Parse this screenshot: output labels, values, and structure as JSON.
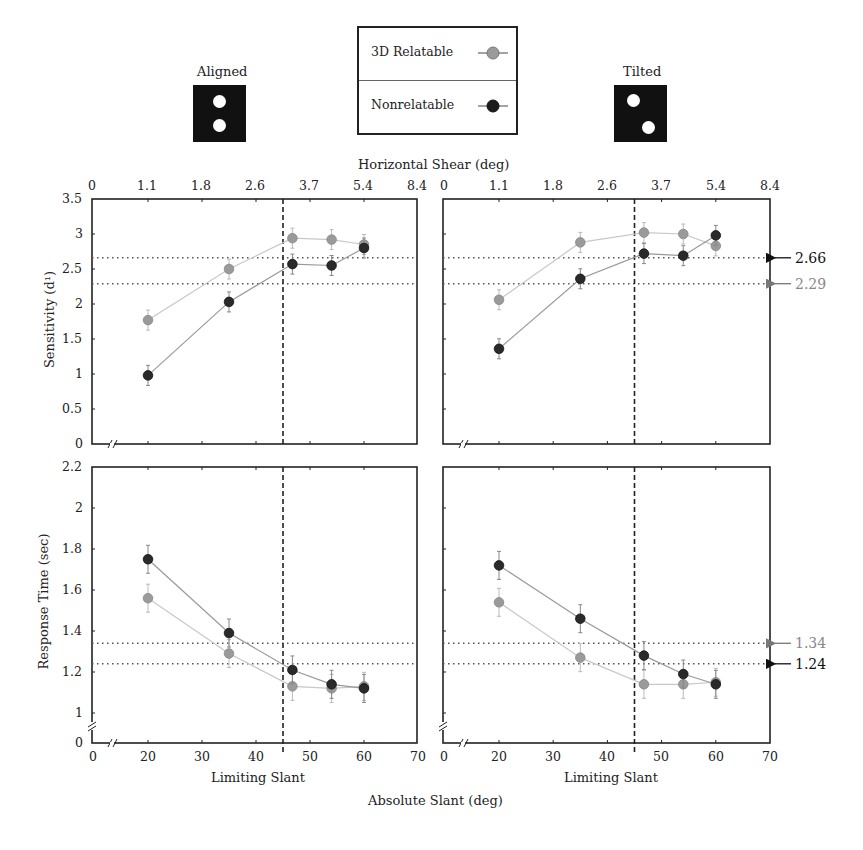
{
  "header": {
    "aligned_label": "Aligned",
    "tilted_label": "Tilted",
    "top_axis_title": "Horizontal Shear (deg)",
    "bottom_axis_title": "Absolute Slant (deg)"
  },
  "legend": {
    "items": [
      {
        "label": "3D Relatable",
        "color": "#9a9a9a"
      },
      {
        "label": "Nonrelatable",
        "color": "#2a2a2a"
      }
    ]
  },
  "axes": {
    "top_ticks": [
      "0",
      "1.1",
      "1.8",
      "2.6",
      "3.7",
      "5.4",
      "8.4"
    ],
    "bottom_ticks": [
      "0",
      "20",
      "30",
      "40",
      "50",
      "60",
      "70"
    ],
    "bottom_xlabel": "Limiting Slant",
    "sens_ylabel": "Sensitivity (d¹)",
    "sens_ticks": [
      "3.5",
      "3",
      "2.5",
      "2",
      "1.5",
      "1",
      "0.5",
      "0"
    ],
    "rt_ylabel": "Response Time (sec)",
    "rt_ticks": [
      "2.2",
      "2",
      "1.8",
      "1.6",
      "1.4",
      "1.2",
      "1",
      "0"
    ]
  },
  "annotations": {
    "sens_ref_high": "2.66",
    "sens_ref_low": "2.29",
    "rt_ref_high": "1.34",
    "rt_ref_low": "1.24"
  },
  "chart_data": [
    {
      "type": "line",
      "title": "Aligned - Sensitivity",
      "xlabel": "Limiting Slant",
      "ylabel": "Sensitivity (d')",
      "x": [
        20,
        35,
        46,
        54,
        60
      ],
      "x2_label": "Horizontal Shear (deg)",
      "x2_ticks": [
        0,
        1.1,
        1.8,
        2.6,
        3.7,
        5.4,
        8.4
      ],
      "ylim": [
        0,
        3.5
      ],
      "series": [
        {
          "name": "3D Relatable",
          "values": [
            1.77,
            2.5,
            2.94,
            2.92,
            2.85
          ]
        },
        {
          "name": "Nonrelatable",
          "values": [
            0.98,
            2.03,
            2.57,
            2.55,
            2.8
          ]
        }
      ],
      "reference_lines": {
        "vertical_x": 45,
        "horizontal_y": [
          2.66,
          2.29
        ]
      }
    },
    {
      "type": "line",
      "title": "Tilted - Sensitivity",
      "xlabel": "Limiting Slant",
      "ylabel": "Sensitivity (d')",
      "x": [
        20,
        35,
        46,
        54,
        60
      ],
      "ylim": [
        0,
        3.5
      ],
      "series": [
        {
          "name": "3D Relatable",
          "values": [
            2.06,
            2.88,
            3.02,
            3.0,
            2.83
          ]
        },
        {
          "name": "Nonrelatable",
          "values": [
            1.36,
            2.36,
            2.72,
            2.69,
            2.98
          ]
        }
      ],
      "reference_lines": {
        "vertical_x": 45,
        "horizontal_y": [
          2.66,
          2.29
        ]
      },
      "annotations": [
        "2.66",
        "2.29"
      ]
    },
    {
      "type": "line",
      "title": "Aligned - Response Time",
      "xlabel": "Limiting Slant",
      "ylabel": "Response Time (sec)",
      "x": [
        20,
        35,
        46,
        54,
        60
      ],
      "ylim": [
        0,
        2.2
      ],
      "series": [
        {
          "name": "3D Relatable",
          "values": [
            1.56,
            1.29,
            1.13,
            1.12,
            1.13
          ]
        },
        {
          "name": "Nonrelatable",
          "values": [
            1.75,
            1.39,
            1.21,
            1.14,
            1.12
          ]
        }
      ],
      "reference_lines": {
        "vertical_x": 45,
        "horizontal_y": [
          1.34,
          1.24
        ]
      }
    },
    {
      "type": "line",
      "title": "Tilted - Response Time",
      "xlabel": "Limiting Slant",
      "ylabel": "Response Time (sec)",
      "x": [
        20,
        35,
        46,
        54,
        60
      ],
      "ylim": [
        0,
        2.2
      ],
      "series": [
        {
          "name": "3D Relatable",
          "values": [
            1.54,
            1.27,
            1.14,
            1.14,
            1.15
          ]
        },
        {
          "name": "Nonrelatable",
          "values": [
            1.72,
            1.46,
            1.28,
            1.19,
            1.14
          ]
        }
      ],
      "reference_lines": {
        "vertical_x": 45,
        "horizontal_y": [
          1.34,
          1.24
        ]
      },
      "annotations": [
        "1.34",
        "1.24"
      ]
    }
  ]
}
